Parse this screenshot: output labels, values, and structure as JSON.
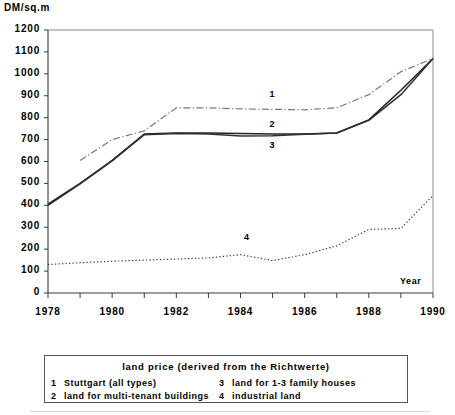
{
  "chart_data": {
    "type": "line",
    "title": "",
    "xlabel": "Year",
    "ylabel": "DM/sq.m",
    "xlim": [
      1978,
      1990
    ],
    "ylim": [
      0,
      1200
    ],
    "ytick_step": 100,
    "xtick_step": 1,
    "xtick_labels": [
      "1978",
      "1980",
      "1982",
      "1984",
      "1986",
      "1988",
      "1990"
    ],
    "xtick_label_years": [
      1978,
      1980,
      1982,
      1984,
      1986,
      1988,
      1990
    ],
    "ytick_labels": [
      "0",
      "100",
      "200",
      "300",
      "400",
      "500",
      "600",
      "700",
      "800",
      "900",
      "1000",
      "1100",
      "1200"
    ],
    "grid": false,
    "legend_position": "below-axes",
    "x": [
      1978,
      1979,
      1980,
      1981,
      1982,
      1983,
      1984,
      1985,
      1986,
      1987,
      1988,
      1989,
      1990
    ],
    "series": [
      {
        "name": "Stuttgart (all types)",
        "key": "1",
        "style": "dash-dot",
        "color": "#7a7a7a",
        "label_point": {
          "x": 1985.0,
          "y": 905
        },
        "values": [
          null,
          605,
          700,
          740,
          845,
          845,
          840,
          838,
          836,
          845,
          905,
          1010,
          1070
        ]
      },
      {
        "name": "land for multi-tenant buildings",
        "key": "2",
        "style": "solid",
        "color": "#202020",
        "label_point": {
          "x": 1985.0,
          "y": 765
        },
        "values": [
          405,
          500,
          605,
          725,
          730,
          730,
          728,
          726,
          726,
          730,
          790,
          925,
          1070
        ]
      },
      {
        "name": "land for 1-3 family houses",
        "key": "3",
        "style": "solid",
        "color": "#303030",
        "label_point": {
          "x": 1985.0,
          "y": 670
        },
        "values": [
          400,
          498,
          603,
          722,
          728,
          726,
          716,
          718,
          724,
          730,
          788,
          905,
          1070
        ]
      },
      {
        "name": "industrial land",
        "key": "4",
        "style": "dotted",
        "color": "#3a3a3a",
        "label_point": {
          "x": 1984.2,
          "y": 252
        },
        "values": [
          130,
          138,
          145,
          150,
          155,
          160,
          175,
          148,
          175,
          215,
          290,
          295,
          445
        ]
      }
    ]
  },
  "legend": {
    "title": "land price (derived from the Richtwerte)",
    "entries": [
      {
        "key": "1",
        "label": "Stuttgart (all types)"
      },
      {
        "key": "3",
        "label": "land for 1-3 family houses"
      },
      {
        "key": "2",
        "label": "land for multi-tenant buildings"
      },
      {
        "key": "4",
        "label": "industrial land"
      }
    ]
  },
  "axes": {
    "y_title": "DM/sq.m",
    "x_title": "Year"
  }
}
